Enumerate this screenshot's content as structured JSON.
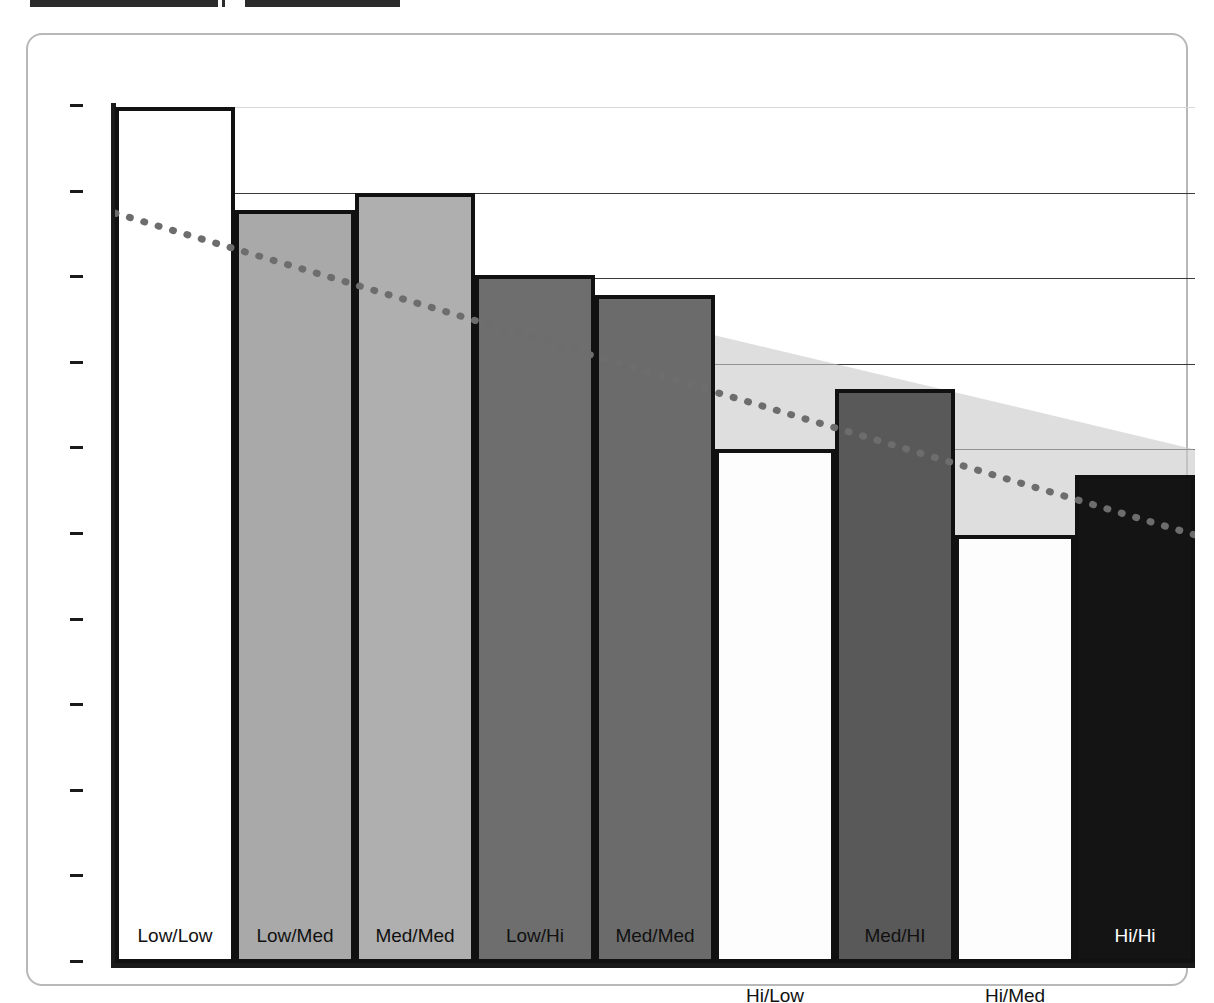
{
  "header": {
    "strip_left": "",
    "strip_right": ""
  },
  "chart_data": {
    "type": "bar",
    "title": "",
    "subtitle": "",
    "xlabel": "",
    "ylabel": "",
    "ylim": [
      50,
      100
    ],
    "xlim": [
      0,
      8
    ],
    "grid": true,
    "legend_position": "none",
    "y_ticks": [
      100,
      95,
      90,
      85,
      80,
      75,
      70,
      65,
      60,
      55,
      50
    ],
    "y_tick_labels": [
      "100",
      "95",
      "90",
      "85",
      "80",
      "75",
      "70",
      "65",
      "60",
      "55",
      "50"
    ],
    "categories": [
      "Low/Low",
      "Low/Med",
      "Med/Med",
      "Low/Hi",
      "Med/Med",
      "Hi/Low",
      "Med/HI",
      "Hi/Med",
      "Hi/Hi"
    ],
    "bars": [
      {
        "label": "Low/Low",
        "value": 100.0,
        "fill": "#ffffff",
        "text_color": "#111111",
        "label_below": false
      },
      {
        "label": "Low/Med",
        "value": 94.0,
        "fill": "#a9a9a9",
        "text_color": "#111111",
        "label_below": false
      },
      {
        "label": "Med/Med",
        "value": 95.0,
        "fill": "#afafaf",
        "text_color": "#111111",
        "label_below": false
      },
      {
        "label": "Low/Hi",
        "value": 90.2,
        "fill": "#6e6e6e",
        "text_color": "#111111",
        "label_below": false
      },
      {
        "label": "Med/Med",
        "value": 89.0,
        "fill": "#6b6b6b",
        "text_color": "#111111",
        "label_below": false
      },
      {
        "label": "Hi/Low",
        "value": 80.0,
        "fill": "#fdfdfd",
        "text_color": "#111111",
        "label_below": true
      },
      {
        "label": "Med/HI",
        "value": 83.5,
        "fill": "#595959",
        "text_color": "#111111",
        "label_below": false
      },
      {
        "label": "Hi/Med",
        "value": 75.0,
        "fill": "#fdfdfd",
        "text_color": "#111111",
        "label_below": true
      },
      {
        "label": "Hi/Hi",
        "value": 78.5,
        "fill": "#141414",
        "text_color": "#ffffff",
        "label_below": false
      }
    ],
    "trend": {
      "name": "trend-line",
      "style": "dotted",
      "color": "#6d6d6d",
      "start": {
        "x": 0.0,
        "y": 93.8
      },
      "end": {
        "x": 8.0,
        "y": 75.0
      }
    },
    "confidence_band": {
      "name": "confidence-band",
      "color": "#c9c9c9",
      "opacity": 0.62,
      "upper_start": 95.0,
      "upper_end": 80.0,
      "lower_start": 92.5,
      "lower_end": 69.5
    }
  },
  "colors": {
    "axis": "#1a1a1a",
    "gridline": "#3a3a3a",
    "frame": "#b8b8b8",
    "background": "#ffffff",
    "bar_outline": "#111111"
  }
}
